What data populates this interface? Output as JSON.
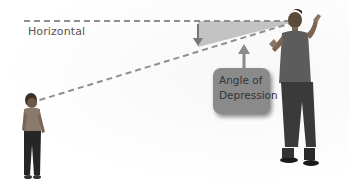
{
  "diagram": {
    "labels": {
      "horizontal": "Horizontal",
      "callout_line1": "Angle of",
      "callout_line2": "Depression"
    },
    "colors": {
      "dashed_line": "#8f8f8f",
      "angle_fill": "#b5b5b5",
      "arrow": "#8a8a8a",
      "callout_bg": "#8a8a8a",
      "callout_text": "#333333",
      "label_text": "#555555"
    },
    "figures": {
      "observer": "adult-man-figure",
      "target": "child-figure"
    }
  }
}
